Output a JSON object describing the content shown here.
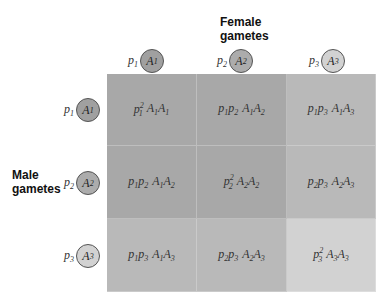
{
  "headers": {
    "female": [
      "Female",
      "gametes"
    ],
    "male": [
      "Male",
      "gametes"
    ]
  },
  "alleles": [
    {
      "freq_base": "p",
      "freq_sub": "1",
      "allele_base": "A",
      "allele_sub": "1",
      "fill": "#a0a0a0"
    },
    {
      "freq_base": "p",
      "freq_sub": "2",
      "allele_base": "A",
      "allele_sub": "2",
      "fill": "#acacac"
    },
    {
      "freq_base": "p",
      "freq_sub": "3",
      "allele_base": "A",
      "allele_sub": "3",
      "fill": "#d2d2d2"
    }
  ],
  "cells": [
    [
      {
        "freq": "p1^2",
        "genotype": "A1A1",
        "fill": "#a8a8a8"
      },
      {
        "freq": "p1p2",
        "genotype": "A1A2",
        "fill": "#a8a8a8"
      },
      {
        "freq": "p1p3",
        "genotype": "A1A3",
        "fill": "#b9b9b9"
      }
    ],
    [
      {
        "freq": "p1p2",
        "genotype": "A1A2",
        "fill": "#a8a8a8"
      },
      {
        "freq": "p2^2",
        "genotype": "A2A2",
        "fill": "#a8a8a8"
      },
      {
        "freq": "p2p3",
        "genotype": "A2A3",
        "fill": "#b9b9b9"
      }
    ],
    [
      {
        "freq": "p1p3",
        "genotype": "A1A3",
        "fill": "#b9b9b9"
      },
      {
        "freq": "p2p3",
        "genotype": "A2A3",
        "fill": "#b9b9b9"
      },
      {
        "freq": "p3^2",
        "genotype": "A3A3",
        "fill": "#d2d2d2"
      }
    ]
  ]
}
